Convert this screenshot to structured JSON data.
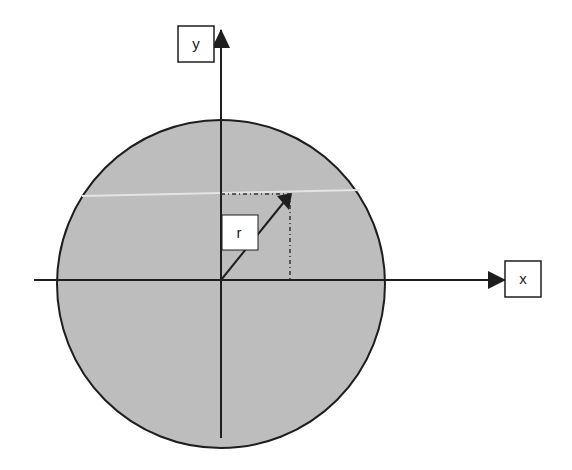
{
  "diagram": {
    "type": "polar-coordinate-circle",
    "labels": {
      "y_axis": "y",
      "x_axis": "x",
      "radius": "r"
    },
    "colors": {
      "circle_fill": "#bdbdbd",
      "stroke": "#1e1e1e",
      "label_box": "#ffffff"
    },
    "geometry": {
      "center": [
        221,
        280
      ],
      "radius": 163,
      "vector_tip": [
        291,
        194
      ]
    }
  }
}
